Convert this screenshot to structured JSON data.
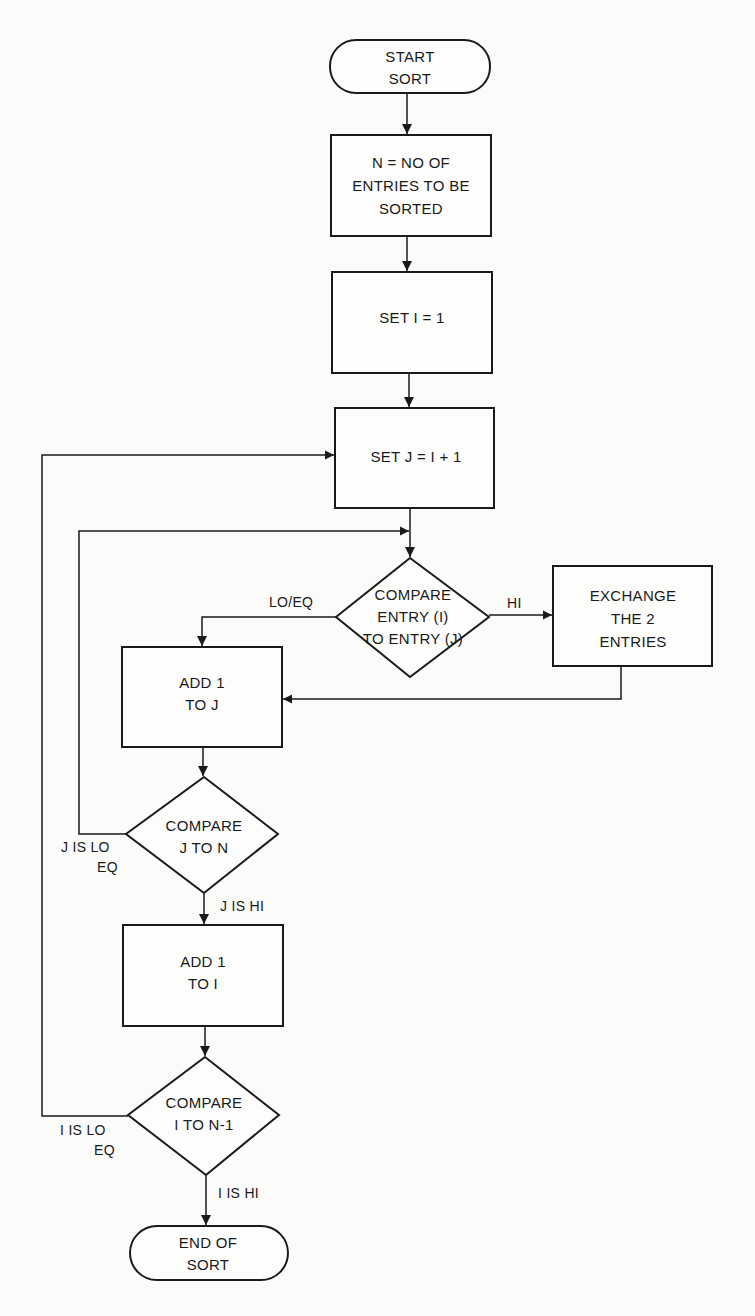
{
  "diagram": {
    "type": "flowchart",
    "nodes": {
      "start": {
        "shape": "terminal",
        "lines": [
          "START",
          "SORT"
        ]
      },
      "set_n": {
        "shape": "process",
        "lines": [
          "N = NO  OF",
          "ENTRIES TO BE",
          "SORTED"
        ]
      },
      "set_i": {
        "shape": "process",
        "lines": [
          "SET I = 1"
        ]
      },
      "set_j": {
        "shape": "process",
        "lines": [
          "SET J = I + 1"
        ]
      },
      "compare_entries": {
        "shape": "decision",
        "lines": [
          "COMPARE",
          "ENTRY (I)",
          "TO ENTRY (J)"
        ]
      },
      "exchange": {
        "shape": "process",
        "lines": [
          "EXCHANGE",
          "THE 2",
          "ENTRIES"
        ]
      },
      "add_j": {
        "shape": "process",
        "lines": [
          "ADD 1",
          "TO J"
        ]
      },
      "compare_j": {
        "shape": "decision",
        "lines": [
          "COMPARE",
          "J TO N"
        ]
      },
      "add_i": {
        "shape": "process",
        "lines": [
          "ADD 1",
          "TO I"
        ]
      },
      "compare_i": {
        "shape": "decision",
        "lines": [
          "COMPARE",
          "I TO N-1"
        ]
      },
      "end": {
        "shape": "terminal",
        "lines": [
          "END OF",
          "SORT"
        ]
      }
    },
    "edge_labels": {
      "lo_eq": "LO/EQ",
      "hi": "HI",
      "j_lo": "J IS LO",
      "j_eq": "EQ",
      "j_hi": "J IS HI",
      "i_lo": "I IS LO",
      "i_eq": "EQ",
      "i_hi": "I IS HI"
    },
    "edges": [
      {
        "from": "start",
        "to": "set_n"
      },
      {
        "from": "set_n",
        "to": "set_i"
      },
      {
        "from": "set_i",
        "to": "set_j"
      },
      {
        "from": "set_j",
        "to": "compare_entries"
      },
      {
        "from": "compare_entries",
        "to": "exchange",
        "label": "HI"
      },
      {
        "from": "compare_entries",
        "to": "add_j",
        "label": "LO/EQ"
      },
      {
        "from": "exchange",
        "to": "add_j"
      },
      {
        "from": "add_j",
        "to": "compare_j"
      },
      {
        "from": "compare_j",
        "to": "compare_entries",
        "label": "J IS LO EQ"
      },
      {
        "from": "compare_j",
        "to": "add_i",
        "label": "J IS HI"
      },
      {
        "from": "add_i",
        "to": "compare_i"
      },
      {
        "from": "compare_i",
        "to": "set_j",
        "label": "I IS LO EQ"
      },
      {
        "from": "compare_i",
        "to": "end",
        "label": "I IS HI"
      }
    ]
  }
}
